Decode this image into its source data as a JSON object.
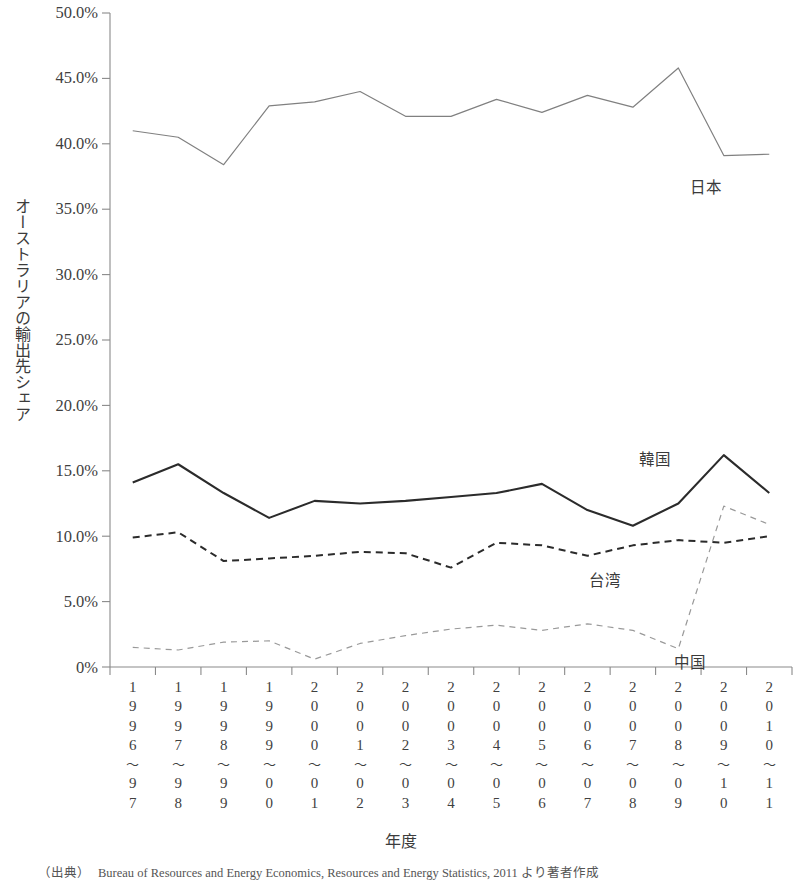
{
  "chart_data": {
    "type": "line",
    "title": "",
    "xlabel": "年度",
    "ylabel": "オーストラリアの輸出先シェア",
    "ylim": [
      0,
      50
    ],
    "y_unit": "%",
    "grid": false,
    "legend_position": "in-plot labels",
    "y_ticks": [
      "0%",
      "5.0%",
      "10.0%",
      "15.0%",
      "20.0%",
      "25.0%",
      "30.0%",
      "35.0%",
      "40.0%",
      "45.0%",
      "50.0%"
    ],
    "y_tick_values": [
      0,
      5,
      10,
      15,
      20,
      25,
      30,
      35,
      40,
      45,
      50
    ],
    "categories": [
      "1996~97",
      "1997~98",
      "1998~99",
      "1999~00",
      "2000~01",
      "2001~02",
      "2002~03",
      "2003~04",
      "2004~05",
      "2005~06",
      "2006~07",
      "2007~08",
      "2008~09",
      "2009~10",
      "2010~11"
    ],
    "category_digits": [
      [
        "1",
        "9",
        "9",
        "6",
        "～",
        "9",
        "7"
      ],
      [
        "1",
        "9",
        "9",
        "7",
        "～",
        "9",
        "8"
      ],
      [
        "1",
        "9",
        "9",
        "8",
        "～",
        "9",
        "9"
      ],
      [
        "1",
        "9",
        "9",
        "9",
        "～",
        "0",
        "0"
      ],
      [
        "2",
        "0",
        "0",
        "0",
        "～",
        "0",
        "1"
      ],
      [
        "2",
        "0",
        "0",
        "1",
        "～",
        "0",
        "2"
      ],
      [
        "2",
        "0",
        "0",
        "2",
        "～",
        "0",
        "3"
      ],
      [
        "2",
        "0",
        "0",
        "3",
        "～",
        "0",
        "4"
      ],
      [
        "2",
        "0",
        "0",
        "4",
        "～",
        "0",
        "5"
      ],
      [
        "2",
        "0",
        "0",
        "5",
        "～",
        "0",
        "6"
      ],
      [
        "2",
        "0",
        "0",
        "6",
        "～",
        "0",
        "7"
      ],
      [
        "2",
        "0",
        "0",
        "7",
        "～",
        "0",
        "8"
      ],
      [
        "2",
        "0",
        "0",
        "8",
        "～",
        "0",
        "9"
      ],
      [
        "2",
        "0",
        "0",
        "9",
        "～",
        "1",
        "0"
      ],
      [
        "2",
        "0",
        "1",
        "0",
        "～",
        "1",
        "1"
      ]
    ],
    "series": [
      {
        "name": "日本",
        "style": "thin-solid",
        "color": "#808080",
        "label_x": 690,
        "label_y": 175,
        "values": [
          41.0,
          40.5,
          38.4,
          42.9,
          43.2,
          44.0,
          42.1,
          42.1,
          43.4,
          42.4,
          43.7,
          42.8,
          45.8,
          39.1,
          39.2
        ]
      },
      {
        "name": "韓国",
        "style": "thick-solid",
        "color": "#2b2b2b",
        "label_x": 639,
        "label_y": 447,
        "values": [
          14.1,
          15.5,
          13.3,
          11.4,
          12.7,
          12.5,
          12.7,
          13.0,
          13.3,
          14.0,
          12.0,
          10.8,
          12.5,
          16.2,
          13.3
        ]
      },
      {
        "name": "台湾",
        "style": "dashed",
        "color": "#2b2b2b",
        "label_x": 589,
        "label_y": 568,
        "values": [
          9.9,
          10.3,
          8.1,
          8.3,
          8.5,
          8.8,
          8.7,
          7.6,
          9.5,
          9.3,
          8.5,
          9.3,
          9.7,
          9.5,
          10.0
        ]
      },
      {
        "name": "中国",
        "style": "fine-dashed",
        "color": "#999999",
        "label_x": 674,
        "label_y": 650,
        "values": [
          1.5,
          1.3,
          1.9,
          2.0,
          0.6,
          1.8,
          2.4,
          2.9,
          3.2,
          2.8,
          3.3,
          2.8,
          1.4,
          12.3,
          10.9
        ]
      }
    ],
    "series_last_values": {
      "日本": 38.0,
      "韓国": 15.2,
      "台湾": 10.0,
      "中国": 10.9
    }
  },
  "footnote": {
    "prefix": "（出典）",
    "text": "Bureau of Resources and Energy Economics, Resources and Energy Statistics, 2011 より著者作成"
  }
}
